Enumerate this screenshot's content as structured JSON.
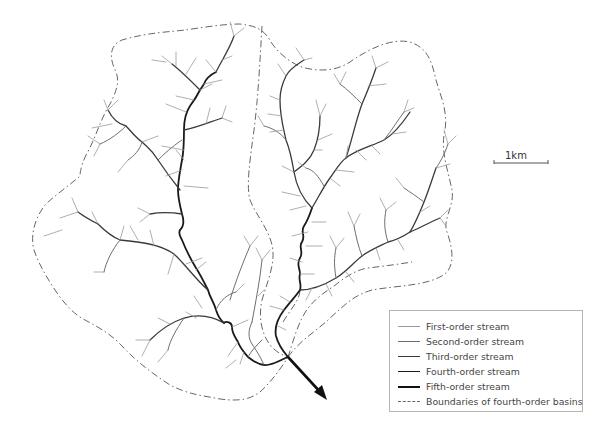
{
  "figure": {
    "scale_bar": {
      "label": "1km"
    }
  },
  "legend": {
    "items": [
      {
        "label": "First-order stream",
        "style": "thin-light"
      },
      {
        "label": "Second-order stream",
        "style": "thin-mid"
      },
      {
        "label": "Third-order stream",
        "style": "medium-dark"
      },
      {
        "label": "Fourth-order stream",
        "style": "thick-dark"
      },
      {
        "label": "Fifth-order stream",
        "style": "thickest-black"
      },
      {
        "label": "Boundaries of fourth-order basins",
        "style": "dash-dot"
      }
    ]
  },
  "colors": {
    "first_order": "#9a9a9a",
    "second_order": "#6e6e6e",
    "third_order": "#3a3a3a",
    "fourth_order": "#1a1a1a",
    "fifth_order": "#111111",
    "boundary": "#666666",
    "legend_border": "#b5b5b5"
  },
  "outlet": {
    "icon": "arrow-down-right-icon"
  }
}
